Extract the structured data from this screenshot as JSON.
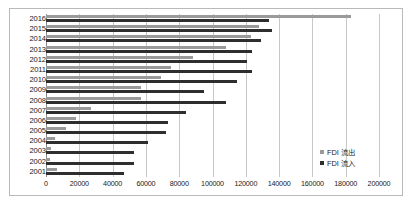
{
  "chart_data": {
    "type": "bar",
    "orientation": "horizontal",
    "title": "",
    "xlabel": "",
    "ylabel": "",
    "categories": [
      "2016",
      "2015",
      "2014",
      "2013",
      "2012",
      "2011",
      "2010",
      "2009",
      "2008",
      "2007",
      "2006",
      "2005",
      "2004",
      "2003",
      "2002",
      "2001"
    ],
    "series": [
      {
        "name": "FDI 流出",
        "color": "#9a9a9a",
        "values": [
          183000,
          128000,
          123000,
          108000,
          88000,
          75000,
          69000,
          57000,
          57000,
          27000,
          18000,
          12000,
          5500,
          2800,
          2500,
          6900
        ]
      },
      {
        "name": "FDI 流入",
        "color": "#2e2e2e",
        "values": [
          134000,
          136000,
          129000,
          124000,
          121000,
          124000,
          115000,
          95000,
          108000,
          84000,
          73000,
          72000,
          61000,
          53000,
          53000,
          47000
        ]
      }
    ],
    "xlim": [
      0,
      200000
    ],
    "xticks": [
      0,
      20000,
      40000,
      60000,
      80000,
      100000,
      120000,
      140000,
      160000,
      180000,
      200000
    ],
    "xtick_labels": [
      "0",
      "20000",
      "40000",
      "60000",
      "80000",
      "100000",
      "120000",
      "140000",
      "160000",
      "180000",
      "200000"
    ],
    "grid": true,
    "grid_axis": "x",
    "legend": {
      "position": "center-right",
      "entries": [
        {
          "label": "FDI 流出",
          "color": "#9a9a9a"
        },
        {
          "label": "FDI 流入",
          "color": "#2e2e2e"
        }
      ]
    },
    "colors": {
      "outflow": "#9a9a9a",
      "inflow": "#2e2e2e",
      "gridline": "#c8c8c8",
      "axis": "#8a8a8a",
      "border": "#b9b9b9",
      "background": "#ffffff",
      "text": "#1a1a1a"
    }
  }
}
